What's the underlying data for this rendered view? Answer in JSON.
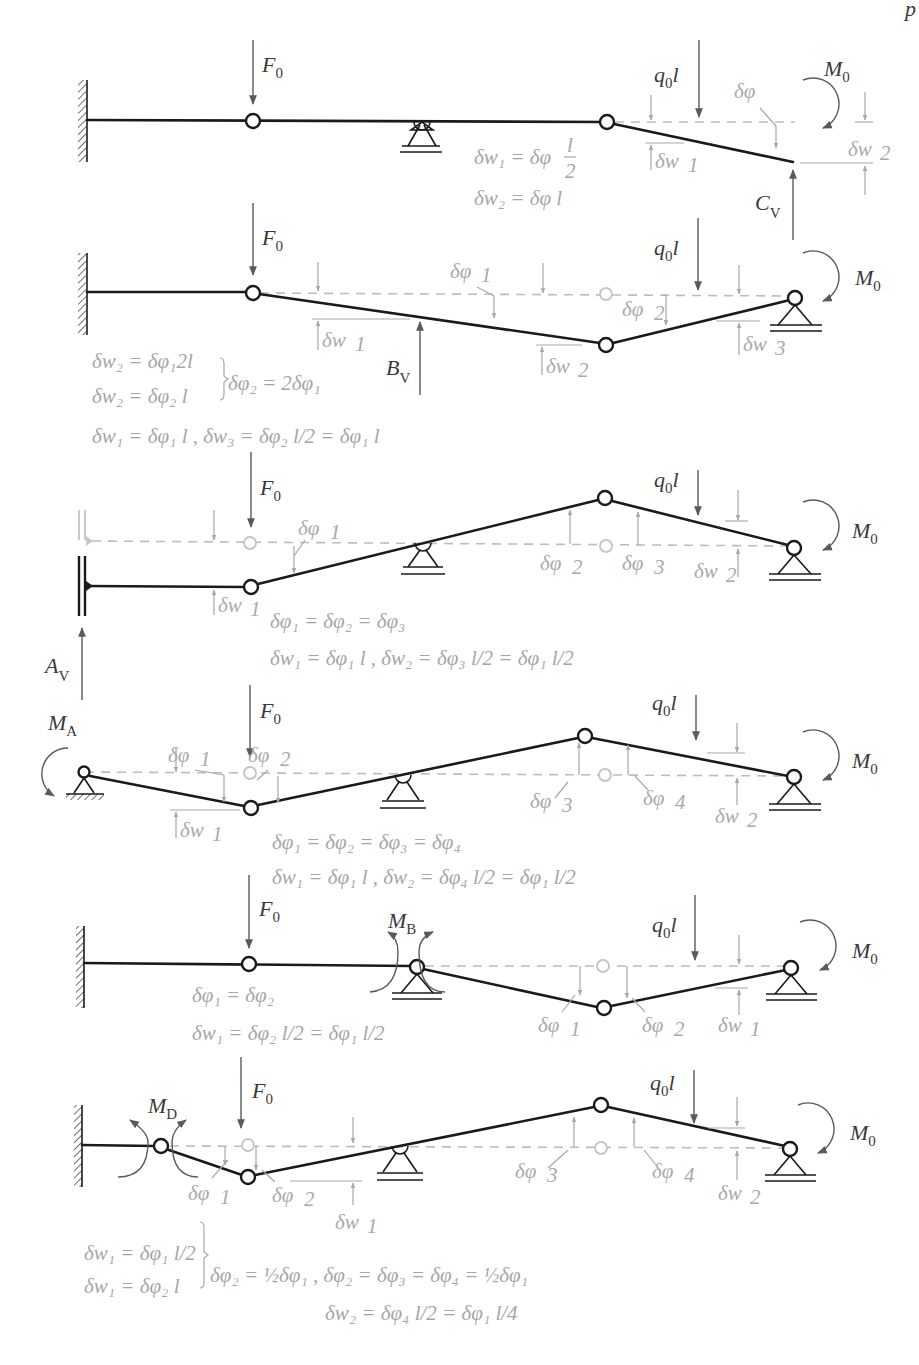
{
  "figure": {
    "header_fragment": "p",
    "panels": [
      {
        "id": "a",
        "loads": {
          "force": "F₀",
          "distributed": "q₀l",
          "moment": "M₀",
          "reaction": "C_V"
        },
        "angle_labels": [
          "δφ"
        ],
        "displacement_labels": [
          "δw₁",
          "δw₂"
        ],
        "equations": [
          "δw₁ = δφ l/2",
          "δw₂ = δφ l"
        ]
      },
      {
        "id": "b",
        "loads": {
          "force": "F₀",
          "distributed": "q₀l",
          "moment": "M₀",
          "reaction": "B_V"
        },
        "angle_labels": [
          "δφ₁",
          "δφ₂"
        ],
        "displacement_labels": [
          "δw₁",
          "δw₂",
          "δw₃"
        ],
        "equations": [
          "δw₂ = δφ₁ 2l",
          "δw₂ = δφ₂ l",
          "δφ₂ = 2δφ₁",
          "δw₁ = δφ₁ l , δw₃ = δφ₂ l/2 = δφ₁ l"
        ]
      },
      {
        "id": "c",
        "loads": {
          "force": "F₀",
          "distributed": "q₀l",
          "moment": "M₀",
          "reaction": "A_V"
        },
        "angle_labels": [
          "δφ₁",
          "δφ₂",
          "δφ₃"
        ],
        "displacement_labels": [
          "δw₁",
          "δw₂"
        ],
        "equations": [
          "δφ₁ = δφ₂ = δφ₃",
          "δw₁ = δφ₁ l , δw₂ = δφ₃ l/2 = δφ₁ l/2"
        ]
      },
      {
        "id": "d",
        "loads": {
          "force": "F₀",
          "distributed": "q₀l",
          "moment": "M₀",
          "reaction": "M_A"
        },
        "angle_labels": [
          "δφ₁",
          "δφ₂",
          "δφ₃",
          "δφ₄"
        ],
        "displacement_labels": [
          "δw₁",
          "δw₂"
        ],
        "equations": [
          "δφ₁ = δφ₂ = δφ₃ = δφ₄",
          "δw₁ = δφ₁ l , δw₂ = δφ₄ l/2 = δφ₁ l/2"
        ]
      },
      {
        "id": "e",
        "loads": {
          "force": "F₀",
          "distributed": "q₀l",
          "moment": "M₀",
          "reaction": "M_B"
        },
        "angle_labels": [
          "δφ₁",
          "δφ₂"
        ],
        "displacement_labels": [
          "δw₁"
        ],
        "equations": [
          "δφ₁ = δφ₂",
          "δw₁ = δφ₂ l/2 = δφ₁ l/2"
        ]
      },
      {
        "id": "f",
        "loads": {
          "force": "F₀",
          "distributed": "q₀l",
          "moment": "M₀",
          "reaction": "M_D"
        },
        "angle_labels": [
          "δφ₁",
          "δφ₂",
          "δφ₃",
          "δφ₄"
        ],
        "displacement_labels": [
          "δw₁",
          "δw₂"
        ],
        "equations": [
          "δw₁ = δφ₁ l/2",
          "δw₁ = δφ₂ l",
          "δφ₂ = ½δφ₁ , δφ₂ = δφ₃ = δφ₄ = ½δφ₁",
          "δw₂ = δφ₄ l/2 = δφ₁ l/4"
        ]
      }
    ],
    "text": {
      "F0": "F",
      "sub0": "0",
      "q0l_q": "q",
      "q0l_l": "l",
      "M": "M",
      "subA": "A",
      "subB": "B",
      "subD": "D",
      "subV": "V",
      "C": "C",
      "Bv": "B",
      "Av": "A",
      "dphi": "δφ",
      "dw": "δw",
      "s1": "1",
      "s2": "2",
      "s3": "3",
      "s4": "4",
      "eqA1": "δw₁ = δφ",
      "eqA1frac": "l/2",
      "eqA2": "δw₂ = δφ l",
      "eqB1": "δw₂ = δφ₁2l",
      "eqB2": "δw₂ = δφ₂ l",
      "eqB3": "δφ₂ = 2δφ₁",
      "eqB4": "δw₁ = δφ₁ l , δw₃ = δφ₂ l/2 = δφ₁ l",
      "eqC1": "δφ₁ = δφ₂ = δφ₃",
      "eqC2": "δw₁ = δφ₁ l , δw₂ = δφ₃ l/2 = δφ₁ l/2",
      "eqD1": "δφ₁ = δφ₂ = δφ₃ = δφ₄",
      "eqD2": "δw₁ = δφ₁ l , δw₂ = δφ₄ l/2 = δφ₁ l/2",
      "eqE1": "δφ₁ = δφ₂",
      "eqE2": "δw₁ = δφ₂ l/2 = δφ₁ l/2",
      "eqF1": "δw₁ = δφ₁ l/2",
      "eqF2": "δw₁ = δφ₂ l",
      "eqF3": "δφ₂ = ½δφ₁ , δφ₂ = δφ₃ = δφ₄ = ½δφ₁",
      "eqF4": "δw₂ = δφ₄ l/2 = δφ₁ l/4"
    }
  }
}
